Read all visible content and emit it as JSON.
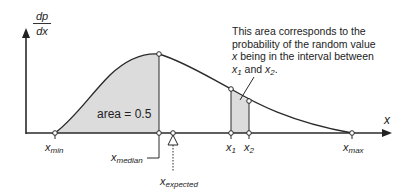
{
  "diagram": {
    "type": "probability density function illustration",
    "y_axis": {
      "label_numerator": "dp",
      "label_denominator": "dx"
    },
    "x_axis": {
      "label": "x"
    },
    "area_label": "area = 0.5",
    "annotation": {
      "line1": "This area corresponds to the",
      "line2": "probability of the random value",
      "line3_var": "x",
      "line3_rest": " being in the interval between",
      "line4_x1": "x",
      "line4_x1_sub": "1",
      "line4_and": " and ",
      "line4_x2": "x",
      "line4_x2_sub": "2",
      "line4_end": "."
    },
    "markers": {
      "x_min": {
        "base": "x",
        "sub": "min"
      },
      "x_median": {
        "base": "x",
        "sub": "median"
      },
      "x_expected": {
        "base": "x",
        "sub": "expected"
      },
      "x1": {
        "base": "x",
        "sub": "1"
      },
      "x2": {
        "base": "x",
        "sub": "2"
      },
      "x_max": {
        "base": "x",
        "sub": "max"
      }
    },
    "colors": {
      "shade": "#d9d9d9",
      "line": "#2a2a2a",
      "background": "#ffffff"
    }
  }
}
